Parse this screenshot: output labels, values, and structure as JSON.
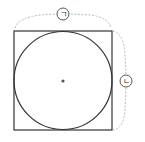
{
  "diagram": {
    "shape": "square with inscribed circle",
    "labels": {
      "top": "ㄱ",
      "right": "ㄴ"
    },
    "colors": {
      "stroke": "#333333",
      "dashed": "#bbbbbb",
      "center": "#555555"
    }
  }
}
